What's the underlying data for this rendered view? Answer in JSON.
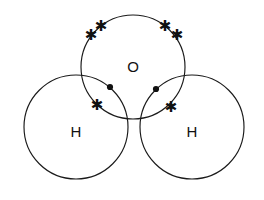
{
  "diagram": {
    "title": "Water molecule Lewis dot-and-cross diagram",
    "type": "lewis-structure",
    "background_color": "#ffffff",
    "stroke_color": "#1a1a1a",
    "electron_color": "#111111",
    "canvas": {
      "width": 264,
      "height": 200
    },
    "atoms": [
      {
        "id": "oxygen",
        "label": "O",
        "cx": 133,
        "cy": 67,
        "r": 52,
        "label_x": 133,
        "label_y": 66
      },
      {
        "id": "hydrogen-left",
        "label": "H",
        "cx": 76,
        "cy": 127,
        "r": 52,
        "label_x": 76,
        "label_y": 131
      },
      {
        "id": "hydrogen-right",
        "label": "H",
        "cx": 192,
        "cy": 127,
        "r": 52,
        "label_x": 192,
        "label_y": 131
      }
    ],
    "electrons": {
      "star_glyph": "✱",
      "cross_marks": [
        {
          "id": "lone-pair-upper-left-a",
          "x": 91,
          "y": 35
        },
        {
          "id": "lone-pair-upper-left-b",
          "x": 101,
          "y": 26
        },
        {
          "id": "lone-pair-upper-right-a",
          "x": 165,
          "y": 26
        },
        {
          "id": "lone-pair-upper-right-b",
          "x": 177,
          "y": 35
        },
        {
          "id": "bond-cross-left",
          "x": 97,
          "y": 105
        },
        {
          "id": "bond-cross-right",
          "x": 171,
          "y": 107
        }
      ],
      "dot_marks": [
        {
          "id": "bond-dot-left",
          "x": 110,
          "y": 87,
          "r": 3.1
        },
        {
          "id": "bond-dot-right",
          "x": 156,
          "y": 89,
          "r": 3.1
        }
      ]
    }
  }
}
